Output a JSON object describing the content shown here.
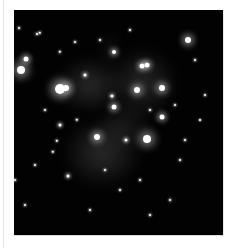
{
  "image": {
    "alt": "Grayscale astrophotograph of the Pleiades star cluster with reflection nebulosity",
    "frame": {
      "left": 14,
      "top": 10,
      "width": 209,
      "height": 225
    },
    "background": "#020202"
  },
  "nebulae": [
    {
      "x": 55,
      "y": 55,
      "w": 70,
      "h": 60,
      "color": "rgba(150,150,150,0.28)"
    },
    {
      "x": 105,
      "y": 45,
      "w": 75,
      "h": 75,
      "color": "rgba(150,150,150,0.26)"
    },
    {
      "x": 60,
      "y": 115,
      "w": 85,
      "h": 75,
      "color": "rgba(140,140,140,0.30)"
    },
    {
      "x": 95,
      "y": 100,
      "w": 60,
      "h": 50,
      "color": "rgba(130,130,130,0.20)"
    },
    {
      "x": 100,
      "y": 30,
      "w": 20,
      "h": 40,
      "color": "rgba(120,120,120,0.18)"
    }
  ],
  "stars": [
    {
      "x": 60,
      "y": 89,
      "r": 5,
      "glow": 9
    },
    {
      "x": 66,
      "y": 88,
      "r": 3,
      "glow": 6
    },
    {
      "x": 21,
      "y": 70,
      "r": 4,
      "glow": 8
    },
    {
      "x": 26,
      "y": 59,
      "r": 2.5,
      "glow": 5
    },
    {
      "x": 188,
      "y": 40,
      "r": 3,
      "glow": 6
    },
    {
      "x": 147,
      "y": 139,
      "r": 4,
      "glow": 8
    },
    {
      "x": 97,
      "y": 137,
      "r": 3,
      "glow": 6
    },
    {
      "x": 137,
      "y": 90,
      "r": 3,
      "glow": 6
    },
    {
      "x": 162,
      "y": 88,
      "r": 3,
      "glow": 6
    },
    {
      "x": 162,
      "y": 117,
      "r": 2.5,
      "glow": 5
    },
    {
      "x": 142,
      "y": 66,
      "r": 2.5,
      "glow": 5
    },
    {
      "x": 147,
      "y": 65,
      "r": 2.5,
      "glow": 5
    },
    {
      "x": 114,
      "y": 52,
      "r": 2,
      "glow": 4
    },
    {
      "x": 114,
      "y": 107,
      "r": 2.5,
      "glow": 5
    },
    {
      "x": 112,
      "y": 96,
      "r": 1.5,
      "glow": 3
    },
    {
      "x": 85,
      "y": 75,
      "r": 1.5,
      "glow": 3
    },
    {
      "x": 126,
      "y": 140,
      "r": 1.5,
      "glow": 3
    },
    {
      "x": 60,
      "y": 125,
      "r": 1.5,
      "glow": 3
    },
    {
      "x": 57,
      "y": 141,
      "r": 1.2,
      "glow": 2
    },
    {
      "x": 53,
      "y": 152,
      "r": 1.2,
      "glow": 2
    },
    {
      "x": 68,
      "y": 176,
      "r": 1.5,
      "glow": 3
    },
    {
      "x": 60,
      "y": 52,
      "r": 1.2,
      "glow": 2
    },
    {
      "x": 40,
      "y": 33,
      "r": 1.2,
      "glow": 2
    },
    {
      "x": 37,
      "y": 34,
      "r": 1,
      "glow": 2
    },
    {
      "x": 19,
      "y": 28,
      "r": 1,
      "glow": 2
    },
    {
      "x": 77,
      "y": 120,
      "r": 1.2,
      "glow": 2
    },
    {
      "x": 150,
      "y": 110,
      "r": 1,
      "glow": 2
    },
    {
      "x": 200,
      "y": 120,
      "r": 1,
      "glow": 2
    },
    {
      "x": 205,
      "y": 95,
      "r": 1,
      "glow": 2
    },
    {
      "x": 180,
      "y": 160,
      "r": 1,
      "glow": 2
    },
    {
      "x": 170,
      "y": 200,
      "r": 1,
      "glow": 2
    },
    {
      "x": 120,
      "y": 190,
      "r": 1,
      "glow": 2
    },
    {
      "x": 90,
      "y": 210,
      "r": 1,
      "glow": 2
    },
    {
      "x": 150,
      "y": 215,
      "r": 1,
      "glow": 2
    },
    {
      "x": 35,
      "y": 165,
      "r": 1,
      "glow": 2
    },
    {
      "x": 15,
      "y": 180,
      "r": 1,
      "glow": 2
    },
    {
      "x": 195,
      "y": 60,
      "r": 1,
      "glow": 2
    },
    {
      "x": 100,
      "y": 40,
      "r": 1,
      "glow": 2
    },
    {
      "x": 130,
      "y": 30,
      "r": 1,
      "glow": 2
    },
    {
      "x": 75,
      "y": 42,
      "r": 1,
      "glow": 2
    },
    {
      "x": 175,
      "y": 105,
      "r": 1,
      "glow": 2
    },
    {
      "x": 45,
      "y": 110,
      "r": 1,
      "glow": 2
    },
    {
      "x": 140,
      "y": 180,
      "r": 1,
      "glow": 2
    },
    {
      "x": 105,
      "y": 170,
      "r": 1,
      "glow": 2
    },
    {
      "x": 185,
      "y": 140,
      "r": 1,
      "glow": 2
    },
    {
      "x": 25,
      "y": 205,
      "r": 1,
      "glow": 2
    }
  ]
}
